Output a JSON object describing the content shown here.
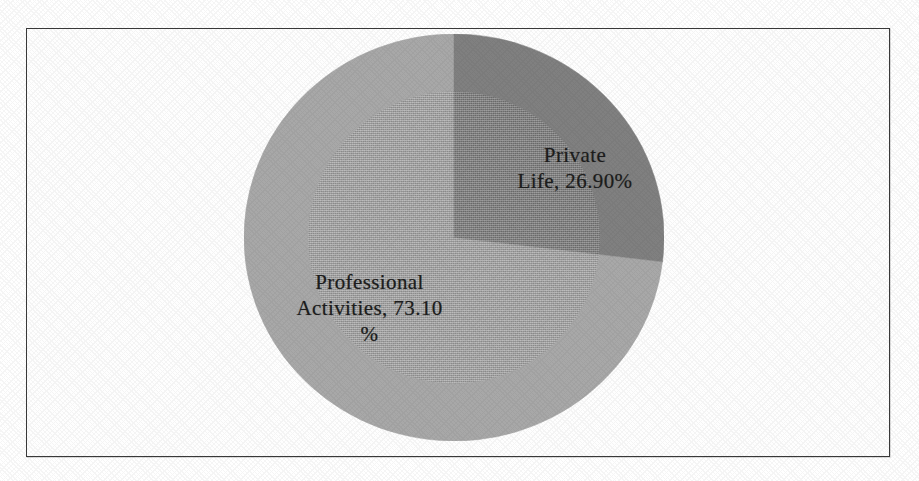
{
  "figure": {
    "background_color": "#ffffff",
    "frame_border_color": "#3a3a3a"
  },
  "chart_data": {
    "type": "pie",
    "title": "",
    "xlabel": "",
    "ylabel": "",
    "grid": false,
    "legend_position": "none",
    "labels_inside_slices": true,
    "start_angle_deg": 0,
    "direction": "clockwise",
    "categories": [
      "Private Life",
      "Professional Activities"
    ],
    "values": [
      26.9,
      73.1
    ],
    "value_unit": "%",
    "colors": [
      "#808080",
      "#a8a8a8"
    ],
    "slices": [
      {
        "name": "Private Life",
        "value": 26.9,
        "percent_text": "26.90%",
        "data_label": "Private\nLife, 26.90%",
        "color": "#808080",
        "sweep_deg": 96.84
      },
      {
        "name": "Professional Activities",
        "value": 73.1,
        "percent_text": "73.10%",
        "data_label": "Professional\nActivities, 73.10\n%",
        "color": "#a8a8a8",
        "sweep_deg": 263.16
      }
    ]
  }
}
